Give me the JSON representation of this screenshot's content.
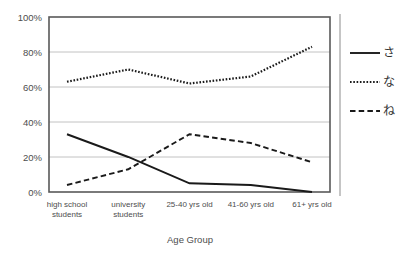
{
  "chart_data": {
    "type": "line",
    "title": "",
    "xlabel": "Age Group",
    "ylabel": "",
    "categories": [
      "high school students",
      "university students",
      "25-40 yrs old",
      "41-60 yrs old",
      "61+ yrs old"
    ],
    "category_lines": [
      [
        "high school",
        "students"
      ],
      [
        "university",
        "students"
      ],
      [
        "25-40 yrs old",
        ""
      ],
      [
        "41-60 yrs old",
        ""
      ],
      [
        "61+ yrs old",
        ""
      ]
    ],
    "series": [
      {
        "name": "さ",
        "style": "solid",
        "color": "#1a1a1a",
        "values": [
          33,
          20,
          5,
          4,
          0
        ]
      },
      {
        "name": "な",
        "style": "dotted",
        "color": "#1a1a1a",
        "values": [
          63,
          70,
          62,
          66,
          83
        ]
      },
      {
        "name": "ね",
        "style": "dashed",
        "color": "#1a1a1a",
        "values": [
          4,
          13,
          33,
          28,
          17
        ]
      }
    ],
    "ylim": [
      0,
      100
    ],
    "yticks": [
      0,
      20,
      40,
      60,
      80,
      100
    ],
    "ytick_labels": [
      "0%",
      "20%",
      "40%",
      "60%",
      "80%",
      "100%"
    ],
    "grid": true,
    "legend_position": "right"
  },
  "legend": {
    "entries": [
      {
        "label": "さ",
        "style": "solid"
      },
      {
        "label": "な",
        "style": "dotted"
      },
      {
        "label": "ね",
        "style": "dashed"
      }
    ]
  },
  "colors": {
    "ink": "#1a1a1a",
    "grid": "#b3b3b3",
    "frame": "#595959",
    "text": "#4d4d4d",
    "background": "#ffffff"
  }
}
